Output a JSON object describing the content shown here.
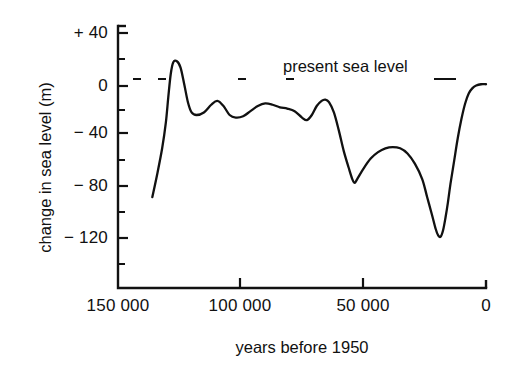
{
  "chart_data": {
    "type": "line",
    "title": "",
    "xlabel": "years before 1950",
    "ylabel": "change in sea level (m)",
    "xlim": [
      150000,
      0
    ],
    "ylim": [
      -140,
      40
    ],
    "x_reversed": true,
    "grid": false,
    "legend": null,
    "x_tick_labels": [
      "150 000",
      "100 000",
      "50 000",
      "0"
    ],
    "x_ticks": [
      150000,
      100000,
      50000,
      0
    ],
    "y_tick_labels": [
      "+ 40",
      "0",
      "− 40",
      "− 80",
      "− 120"
    ],
    "y_ticks": [
      40,
      0,
      -40,
      -80,
      -120
    ],
    "y_minor_ticks": [
      20,
      -20,
      -60,
      -100,
      -140
    ],
    "annotations": [
      {
        "text": "present sea level",
        "x": 60000,
        "y": 0,
        "kind": "reference-line-label"
      }
    ],
    "reference_line": {
      "y": 0,
      "style": "dashed",
      "label": "present sea level"
    },
    "series": [
      {
        "name": "change in sea level",
        "units": "m",
        "points": [
          [
            136000,
            -88
          ],
          [
            134000,
            -70
          ],
          [
            132000,
            -50
          ],
          [
            130500,
            -30
          ],
          [
            129500,
            -10
          ],
          [
            128500,
            8
          ],
          [
            127500,
            17
          ],
          [
            126000,
            18
          ],
          [
            124500,
            13
          ],
          [
            123000,
            0
          ],
          [
            121500,
            -14
          ],
          [
            120000,
            -22
          ],
          [
            118000,
            -24
          ],
          [
            115000,
            -22
          ],
          [
            112000,
            -16
          ],
          [
            109500,
            -13
          ],
          [
            107000,
            -17
          ],
          [
            104500,
            -24
          ],
          [
            102000,
            -26
          ],
          [
            99000,
            -25
          ],
          [
            96000,
            -21
          ],
          [
            93000,
            -17
          ],
          [
            90000,
            -15
          ],
          [
            87000,
            -16
          ],
          [
            84000,
            -18
          ],
          [
            81000,
            -19
          ],
          [
            78000,
            -21
          ],
          [
            75000,
            -26
          ],
          [
            73000,
            -28
          ],
          [
            71000,
            -24
          ],
          [
            69000,
            -17
          ],
          [
            67000,
            -13
          ],
          [
            65500,
            -12
          ],
          [
            64000,
            -14
          ],
          [
            62000,
            -22
          ],
          [
            60000,
            -36
          ],
          [
            58000,
            -52
          ],
          [
            56000,
            -65
          ],
          [
            54500,
            -74
          ],
          [
            53500,
            -77
          ],
          [
            52500,
            -74
          ],
          [
            50000,
            -66
          ],
          [
            47000,
            -58
          ],
          [
            44000,
            -53
          ],
          [
            41000,
            -50
          ],
          [
            38000,
            -49
          ],
          [
            35000,
            -50
          ],
          [
            32000,
            -54
          ],
          [
            29000,
            -62
          ],
          [
            26000,
            -74
          ],
          [
            24000,
            -88
          ],
          [
            22000,
            -102
          ],
          [
            20500,
            -113
          ],
          [
            19500,
            -118
          ],
          [
            18500,
            -119
          ],
          [
            17500,
            -114
          ],
          [
            16500,
            -104
          ],
          [
            15500,
            -92
          ],
          [
            14500,
            -78
          ],
          [
            13000,
            -60
          ],
          [
            11500,
            -42
          ],
          [
            10000,
            -27
          ],
          [
            8500,
            -15
          ],
          [
            7000,
            -7
          ],
          [
            5500,
            -3
          ],
          [
            4000,
            -1
          ],
          [
            2000,
            0
          ],
          [
            0,
            0
          ]
        ]
      }
    ]
  }
}
